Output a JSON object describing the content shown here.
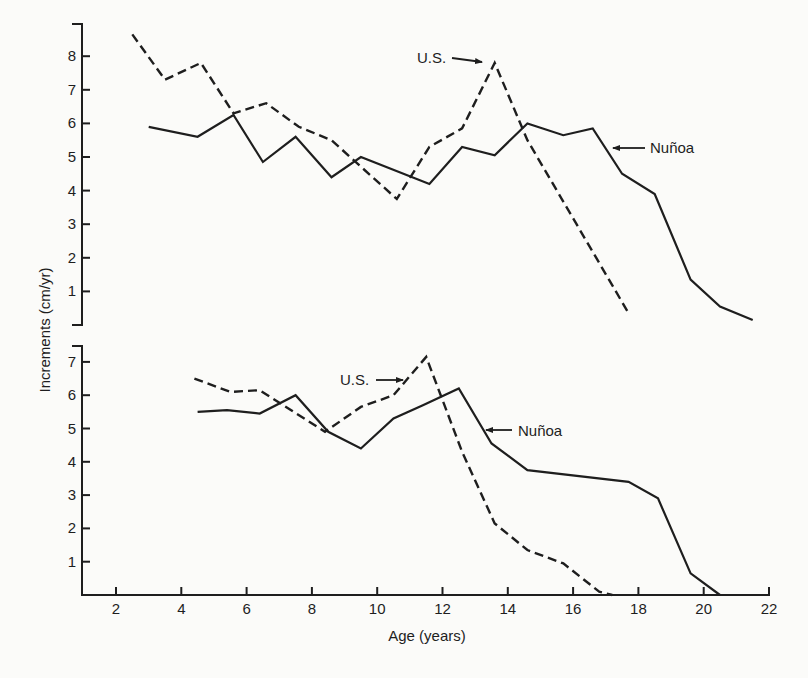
{
  "chart_data": [
    {
      "type": "line",
      "panel": "top",
      "title": "",
      "xlabel": "Age (years)",
      "ylabel": "Increments (cm/yr)",
      "ylim": [
        0,
        8.8
      ],
      "xlim": [
        1,
        22
      ],
      "yticks": [
        1,
        2,
        3,
        4,
        5,
        6,
        7,
        8
      ],
      "grid": false,
      "legend": "inline labels with arrows",
      "series": [
        {
          "name": "Nuñoa",
          "style": "solid",
          "x": [
            3.0,
            4.5,
            5.6,
            6.5,
            7.5,
            8.6,
            9.5,
            11.6,
            12.6,
            13.6,
            14.6,
            15.7,
            16.6,
            17.5,
            18.5,
            19.6,
            20.5,
            21.5
          ],
          "y": [
            5.9,
            5.6,
            6.25,
            4.85,
            5.6,
            4.4,
            5.0,
            4.2,
            5.3,
            5.05,
            6.0,
            5.65,
            5.85,
            4.5,
            3.9,
            1.35,
            0.55,
            0.15
          ]
        },
        {
          "name": "U.S.",
          "style": "dashed",
          "x": [
            2.5,
            3.5,
            4.6,
            5.6,
            6.6,
            7.6,
            8.6,
            10.6,
            11.6,
            12.6,
            13.6,
            14.6,
            17.7
          ],
          "y": [
            8.65,
            7.3,
            7.8,
            6.3,
            6.6,
            5.9,
            5.5,
            3.75,
            5.3,
            5.85,
            7.8,
            5.5,
            0.35
          ]
        }
      ],
      "annotations": [
        {
          "text": "U.S.",
          "arrow_to": "U.S. peak near age 13.5"
        },
        {
          "text": "Nuñoa",
          "arrow_to": "Nuñoa line near age 17"
        }
      ]
    },
    {
      "type": "line",
      "panel": "bottom",
      "title": "",
      "xlabel": "Age (years)",
      "ylabel": "Increments (cm/yr)",
      "ylim": [
        0,
        7.5
      ],
      "xlim": [
        1,
        22
      ],
      "xticks": [
        2,
        4,
        6,
        8,
        10,
        12,
        14,
        16,
        18,
        20,
        22
      ],
      "yticks": [
        1,
        2,
        3,
        4,
        5,
        6,
        7
      ],
      "grid": false,
      "legend": "inline labels with arrows",
      "series": [
        {
          "name": "Nuñoa",
          "style": "solid",
          "x": [
            4.5,
            5.4,
            6.4,
            7.5,
            8.5,
            9.5,
            10.5,
            11.4,
            12.5,
            13.5,
            14.6,
            17.7,
            18.6,
            19.6,
            20.5
          ],
          "y": [
            5.5,
            5.55,
            5.45,
            6.0,
            4.9,
            4.4,
            5.3,
            5.7,
            6.2,
            4.55,
            3.75,
            3.4,
            2.9,
            0.65,
            0.0
          ]
        },
        {
          "name": "U.S.",
          "style": "dashed",
          "x": [
            4.4,
            5.5,
            6.4,
            8.4,
            9.5,
            10.5,
            11.5,
            12.6,
            13.6,
            14.6,
            15.7,
            16.8,
            17.2
          ],
          "y": [
            6.5,
            6.1,
            6.15,
            4.9,
            5.65,
            6.0,
            7.15,
            4.3,
            2.15,
            1.35,
            0.95,
            0.1,
            0.0
          ]
        }
      ],
      "annotations": [
        {
          "text": "U.S.",
          "arrow_to": "U.S. peak near age 11.5"
        },
        {
          "text": "Nuñoa",
          "arrow_to": "Nuñoa line near age 13"
        }
      ]
    }
  ],
  "labels": {
    "y_axis_title": "Increments (cm/yr)",
    "x_axis_title": "Age (years)",
    "top_us": "U.S.",
    "top_nunoa": "Nuñoa",
    "bottom_us": "U.S.",
    "bottom_nunoa": "Nuñoa",
    "top_yticks": [
      "1",
      "2",
      "3",
      "4",
      "5",
      "6",
      "7",
      "8"
    ],
    "bottom_yticks": [
      "1",
      "2",
      "3",
      "4",
      "5",
      "6",
      "7"
    ],
    "xticks": [
      "2",
      "4",
      "6",
      "8",
      "10",
      "12",
      "14",
      "16",
      "18",
      "20",
      "22"
    ]
  },
  "colors": {
    "ink": "#1e1e1e",
    "paper": "#fbfbf9"
  }
}
